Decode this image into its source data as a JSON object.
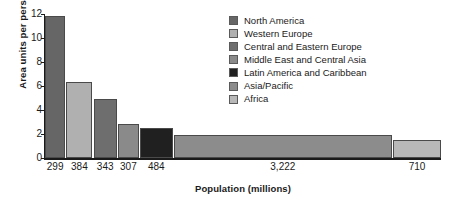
{
  "chart_data": {
    "type": "bar",
    "variant": "variable-width-bar",
    "title": "",
    "xlabel": "Population (millions)",
    "ylabel": "Area units per person",
    "ylim": [
      0,
      12
    ],
    "yticks": [
      0,
      2,
      4,
      6,
      8,
      10,
      12
    ],
    "ytick_labels": [
      "0",
      "2",
      "4",
      "6",
      "8",
      "10",
      "12"
    ],
    "grid": false,
    "legend_position": "top-right",
    "categories": [
      "North America",
      "Western Europe",
      "Central and Eastern Europe",
      "Middle East and Central Asia",
      "Latin America and Caribbean",
      "Asia/Pacific",
      "Africa"
    ],
    "values": [
      11.8,
      6.3,
      4.9,
      2.8,
      2.5,
      1.9,
      1.5
    ],
    "widths": [
      299,
      384,
      343,
      307,
      484,
      3222,
      710
    ],
    "width_unit": "millions of people",
    "xtick_labels": [
      "299",
      "384",
      "343",
      "307",
      "484",
      "3,222",
      "710"
    ],
    "colors": [
      "#666666",
      "#b0b0b0",
      "#6e6e6e",
      "#8a8a8a",
      "#202020",
      "#8c8c8c",
      "#b8b8b8"
    ],
    "series": [
      {
        "name": "Area units per person",
        "values": [
          11.8,
          6.3,
          4.9,
          2.8,
          2.5,
          1.9,
          1.5
        ]
      }
    ]
  },
  "legend": {
    "items": [
      {
        "label": "North America",
        "color": "#666666"
      },
      {
        "label": "Western Europe",
        "color": "#b0b0b0"
      },
      {
        "label": "Central and Eastern Europe",
        "color": "#6e6e6e"
      },
      {
        "label": "Middle East and Central Asia",
        "color": "#8a8a8a"
      },
      {
        "label": "Latin America and Caribbean",
        "color": "#202020"
      },
      {
        "label": "Asia/Pacific",
        "color": "#8c8c8c"
      },
      {
        "label": "Africa",
        "color": "#b8b8b8"
      }
    ]
  }
}
